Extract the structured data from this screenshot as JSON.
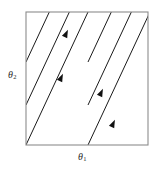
{
  "figure": {
    "kind": "phase-portrait",
    "background_color": "#ffffff",
    "width": 161,
    "height": 173
  },
  "box": {
    "name": "torus-square",
    "x": 26,
    "y": 12,
    "width": 122,
    "height": 133,
    "stroke_color": "#8c8c8c",
    "stroke_width": 1.1,
    "fill": "#ffffff"
  },
  "axes": {
    "x_label": {
      "symbol": "θ",
      "subscript": "1",
      "text": "θ1",
      "x": 85,
      "y": 158
    },
    "y_label": {
      "symbol": "θ",
      "subscript": "2",
      "text": "θ2",
      "x": 14,
      "y": 76
    },
    "label_color": "#2b2b2b"
  },
  "trajectories": {
    "count": 4,
    "stroke_color": "#1a1a1a",
    "stroke_width": 1.0,
    "direction": "up-right",
    "slope_note": "parallel lines of constant slope, wrapping at the square boundary",
    "lines": [
      {
        "id": "line-1",
        "x1": 26,
        "y1": 145,
        "x2": 88,
        "y2": 12
      },
      {
        "id": "line-2",
        "x1": 26,
        "y1": 105,
        "x2": 88,
        "y2": -28
      },
      {
        "id": "line-3",
        "x1": 88,
        "y1": 145,
        "x2": 150,
        "y2": 12
      },
      {
        "id": "line-4",
        "x1": 26,
        "y1": 62,
        "x2": 88,
        "y2": -71
      },
      {
        "id": "line-5",
        "x1": 88,
        "y1": 105,
        "x2": 150,
        "y2": -28
      },
      {
        "id": "line-6",
        "x1": 88,
        "y1": 62,
        "x2": 150,
        "y2": -71
      }
    ],
    "arrows": [
      {
        "id": "arrow-1",
        "x": 66,
        "y": 34,
        "angle": -65
      },
      {
        "id": "arrow-2",
        "x": 61,
        "y": 78,
        "angle": -65
      },
      {
        "id": "arrow-3",
        "x": 101,
        "y": 93,
        "angle": -65
      },
      {
        "id": "arrow-4",
        "x": 113,
        "y": 124,
        "angle": -65
      }
    ],
    "arrow_color": "#111111"
  },
  "colors": {
    "line": "#1a1a1a",
    "border": "#8c8c8c",
    "text": "#2b2b2b",
    "background": "#ffffff"
  }
}
